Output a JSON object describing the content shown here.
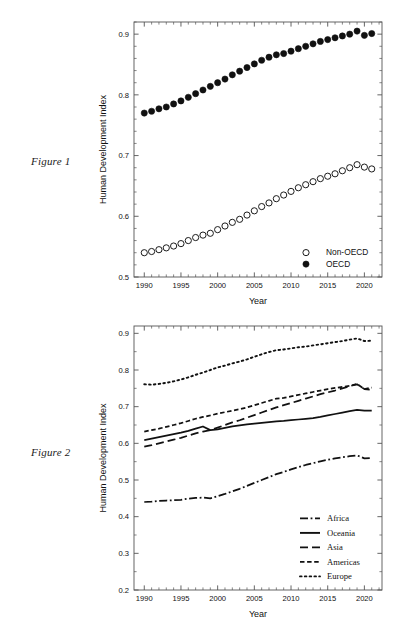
{
  "page": {
    "background": "#ffffff",
    "figure1_caption": "Figure 1",
    "figure2_caption": "Figure 2",
    "top_clipped_text": "· ··   ·"
  },
  "chart_data": [
    {
      "id": "figure1",
      "type": "scatter",
      "title": "",
      "xlabel": "Year",
      "ylabel": "Human Development Index",
      "xlim": [
        1988.6,
        2022.4
      ],
      "ylim": [
        0.5,
        0.92
      ],
      "grid": false,
      "frame": "box",
      "legend_position": "bottom-right",
      "xticks": [
        1990,
        1995,
        2000,
        2005,
        2010,
        2015,
        2020
      ],
      "xticklabels": [
        "1990",
        "1995",
        "2000",
        "2005",
        "2010",
        "2015",
        "2020"
      ],
      "xminorticks": [
        1991,
        1992,
        1993,
        1994,
        1996,
        1997,
        1998,
        1999,
        2001,
        2002,
        2003,
        2004,
        2006,
        2007,
        2008,
        2009,
        2011,
        2012,
        2013,
        2014,
        2016,
        2017,
        2018,
        2019,
        2021,
        2022
      ],
      "yticks": [
        0.5,
        0.6,
        0.7,
        0.8,
        0.9
      ],
      "yticklabels": [
        "0.5",
        "0.6",
        "0.7",
        "0.8",
        "0.9"
      ],
      "yminorticks": [
        0.52,
        0.54,
        0.56,
        0.58,
        0.62,
        0.64,
        0.66,
        0.68,
        0.72,
        0.74,
        0.76,
        0.78,
        0.82,
        0.84,
        0.86,
        0.88,
        0.92
      ],
      "x": [
        1990,
        1991,
        1992,
        1993,
        1994,
        1995,
        1996,
        1997,
        1998,
        1999,
        2000,
        2001,
        2002,
        2003,
        2004,
        2005,
        2006,
        2007,
        2008,
        2009,
        2010,
        2011,
        2012,
        2013,
        2014,
        2015,
        2016,
        2017,
        2018,
        2019,
        2020,
        2021
      ],
      "series": [
        {
          "name": "OECD",
          "marker": "filled-circle",
          "color": "#111111",
          "values": [
            0.77,
            0.773,
            0.777,
            0.78,
            0.785,
            0.79,
            0.796,
            0.802,
            0.808,
            0.814,
            0.82,
            0.826,
            0.833,
            0.839,
            0.845,
            0.851,
            0.857,
            0.862,
            0.866,
            0.868,
            0.872,
            0.876,
            0.88,
            0.884,
            0.888,
            0.891,
            0.894,
            0.897,
            0.9,
            0.905,
            0.898,
            0.901
          ]
        },
        {
          "name": "Non-OECD",
          "marker": "open-circle",
          "color": "#111111",
          "values": [
            0.54,
            0.542,
            0.545,
            0.548,
            0.551,
            0.555,
            0.56,
            0.565,
            0.569,
            0.572,
            0.578,
            0.584,
            0.59,
            0.595,
            0.602,
            0.609,
            0.616,
            0.622,
            0.629,
            0.635,
            0.641,
            0.647,
            0.652,
            0.657,
            0.662,
            0.666,
            0.67,
            0.675,
            0.68,
            0.685,
            0.681,
            0.678
          ]
        }
      ]
    },
    {
      "id": "figure2",
      "type": "line",
      "title": "",
      "xlabel": "Year",
      "ylabel": "Human Development Index",
      "xlim": [
        1988.6,
        2022.4
      ],
      "ylim": [
        0.2,
        0.92
      ],
      "grid": false,
      "frame": "box",
      "legend_position": "bottom-right",
      "xticks": [
        1990,
        1995,
        2000,
        2005,
        2010,
        2015,
        2020
      ],
      "xticklabels": [
        "1990",
        "1995",
        "2000",
        "2005",
        "2010",
        "2015",
        "2020"
      ],
      "xminorticks": [
        1991,
        1992,
        1993,
        1994,
        1996,
        1997,
        1998,
        1999,
        2001,
        2002,
        2003,
        2004,
        2006,
        2007,
        2008,
        2009,
        2011,
        2012,
        2013,
        2014,
        2016,
        2017,
        2018,
        2019,
        2021,
        2022
      ],
      "yticks": [
        0.2,
        0.3,
        0.4,
        0.5,
        0.6,
        0.7,
        0.8,
        0.9
      ],
      "yticklabels": [
        "0.2",
        "0.3",
        "0.4",
        "0.5",
        "0.6",
        "0.7",
        "0.8",
        "0.9"
      ],
      "yminorticks": [
        0.25,
        0.35,
        0.45,
        0.55,
        0.65,
        0.75,
        0.85
      ],
      "x": [
        1990,
        1991,
        1992,
        1993,
        1994,
        1995,
        1996,
        1997,
        1998,
        1999,
        2000,
        2001,
        2002,
        2003,
        2004,
        2005,
        2006,
        2007,
        2008,
        2009,
        2010,
        2011,
        2012,
        2013,
        2014,
        2015,
        2016,
        2017,
        2018,
        2019,
        2020,
        2021
      ],
      "series": [
        {
          "name": "Europe",
          "style": "dotted",
          "color": "#111111",
          "values": [
            0.761,
            0.76,
            0.762,
            0.765,
            0.769,
            0.774,
            0.78,
            0.787,
            0.793,
            0.8,
            0.807,
            0.812,
            0.818,
            0.823,
            0.829,
            0.836,
            0.843,
            0.849,
            0.854,
            0.856,
            0.859,
            0.862,
            0.864,
            0.867,
            0.87,
            0.873,
            0.876,
            0.879,
            0.883,
            0.886,
            0.879,
            0.88
          ]
        },
        {
          "name": "Americas",
          "style": "dashed",
          "color": "#111111",
          "values": [
            0.632,
            0.636,
            0.64,
            0.645,
            0.65,
            0.655,
            0.661,
            0.667,
            0.672,
            0.676,
            0.681,
            0.685,
            0.689,
            0.693,
            0.698,
            0.704,
            0.71,
            0.716,
            0.722,
            0.724,
            0.728,
            0.732,
            0.736,
            0.74,
            0.744,
            0.748,
            0.751,
            0.754,
            0.757,
            0.762,
            0.748,
            0.752
          ]
        },
        {
          "name": "Asia",
          "style": "longdash",
          "color": "#111111",
          "values": [
            0.591,
            0.595,
            0.6,
            0.605,
            0.61,
            0.615,
            0.621,
            0.627,
            0.632,
            0.636,
            0.643,
            0.65,
            0.657,
            0.663,
            0.67,
            0.677,
            0.684,
            0.691,
            0.698,
            0.704,
            0.71,
            0.716,
            0.722,
            0.728,
            0.734,
            0.739,
            0.744,
            0.75,
            0.756,
            0.761,
            0.748,
            0.746
          ]
        },
        {
          "name": "Oceania",
          "style": "solid",
          "color": "#111111",
          "values": [
            0.609,
            0.613,
            0.617,
            0.621,
            0.625,
            0.629,
            0.634,
            0.64,
            0.646,
            0.636,
            0.638,
            0.642,
            0.646,
            0.649,
            0.652,
            0.654,
            0.656,
            0.658,
            0.66,
            0.661,
            0.663,
            0.665,
            0.667,
            0.669,
            0.672,
            0.676,
            0.68,
            0.684,
            0.688,
            0.691,
            0.689,
            0.689
          ]
        },
        {
          "name": "Africa",
          "style": "dashdot",
          "color": "#111111",
          "values": [
            0.44,
            0.441,
            0.443,
            0.444,
            0.445,
            0.446,
            0.449,
            0.451,
            0.452,
            0.45,
            0.456,
            0.462,
            0.469,
            0.476,
            0.484,
            0.492,
            0.5,
            0.508,
            0.516,
            0.522,
            0.529,
            0.535,
            0.541,
            0.546,
            0.551,
            0.555,
            0.559,
            0.562,
            0.565,
            0.567,
            0.559,
            0.56
          ]
        }
      ]
    }
  ]
}
